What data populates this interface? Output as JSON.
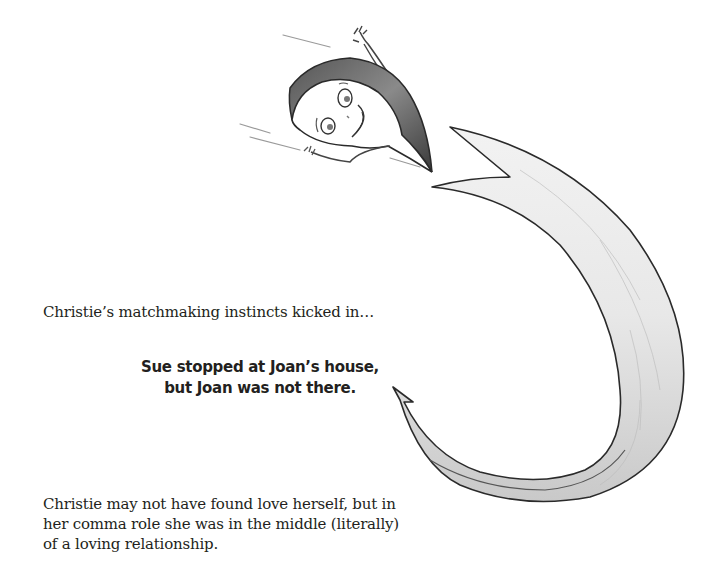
{
  "page": {
    "intro_text": "Christie’s matchmaking instincts kicked in…",
    "example_sentence": {
      "line1": "Sue stopped at Joan’s house,",
      "line2": "but Joan was not there."
    },
    "conclusion": {
      "line1": "Christie may not have found love herself, but in",
      "line2": "her comma role she was in the middle (literally)",
      "line3": "of a loving relationship."
    }
  },
  "illustration": {
    "character": "comma-character",
    "arrow": "swoosh-arrow",
    "colors": {
      "ink": "#2a2a2a",
      "shade": "#d9d9d9",
      "paper": "#ffffff"
    }
  }
}
